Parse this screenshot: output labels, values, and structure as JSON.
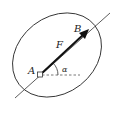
{
  "diagram": {
    "type": "force-on-rigid-body",
    "labels": {
      "point_a": "A",
      "point_b": "B",
      "force": "F",
      "angle": "α"
    },
    "colors": {
      "stroke": "#333333",
      "arrow": "#111111",
      "dashed": "#555555",
      "background": "#ffffff"
    }
  }
}
